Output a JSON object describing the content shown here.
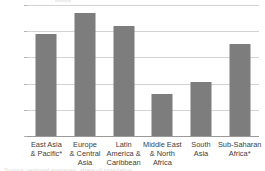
{
  "chart_data": {
    "type": "bar",
    "title": "",
    "subtitle": "",
    "xlabel": "",
    "ylabel": "",
    "ylim": [
      0,
      50
    ],
    "yticks": [
      0,
      10,
      20,
      30,
      40,
      50
    ],
    "ytick_labels": [
      "0",
      "10",
      "20",
      "30",
      "40",
      "50"
    ],
    "grid": true,
    "legend": false,
    "legend_position": "none",
    "bar_color": "#7d7d7d",
    "gridline_color": "#d3d3d3",
    "axis_color": "#9a9a9a",
    "categories": [
      "East Asia & Pacific*",
      "Europe & Central Asia",
      "Latin America & Caribbean",
      "Middle East & North Africa",
      "South Asia",
      "Sub-Saharan Africa*"
    ],
    "category_lines": [
      [
        "East Asia",
        "& Pacific*"
      ],
      [
        "Europe",
        "& Central",
        "Asia"
      ],
      [
        "Latin",
        "America &",
        "Caribbean"
      ],
      [
        "Middle East",
        "& North",
        "Africa"
      ],
      [
        "South",
        "Asia"
      ],
      [
        "Sub-Saharan",
        "Africa*"
      ]
    ],
    "values": [
      39,
      47,
      42,
      16,
      20.5,
      35
    ],
    "annotations": []
  },
  "footnote": {
    "cropped_caption": "Source: regional averages, share of population"
  }
}
